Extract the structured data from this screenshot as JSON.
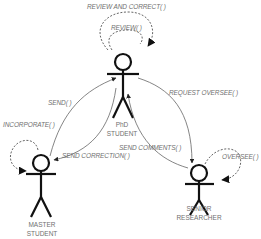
{
  "diagram": {
    "type": "actor interaction diagram",
    "actors": [
      {
        "id": "phd",
        "line1": "PhD",
        "line2": "STUDENT"
      },
      {
        "id": "master",
        "line1": "MASTER",
        "line2": "STUDENT"
      },
      {
        "id": "senior",
        "line1": "SENIOR",
        "line2": "RESEARCHER"
      }
    ],
    "messages": {
      "review_and_correct": "REVIEW AND CORRECT( )",
      "review": "REVIEW( )",
      "send": "SEND( )",
      "request_oversee": "REQUEST OVERSEE( )",
      "incorporate": "INCORPORATE( )",
      "send_comments": "SEND COMMENTS( )",
      "send_correction": "SEND CORRECTION( )",
      "oversee": "OVERSEE( )"
    },
    "edges": [
      {
        "from": "phd",
        "to": "phd",
        "label": "REVIEW AND CORRECT( )",
        "style": "dashed"
      },
      {
        "from": "phd",
        "to": "phd",
        "label": "REVIEW( )",
        "style": "dashed"
      },
      {
        "from": "master",
        "to": "phd",
        "label": "SEND( )",
        "style": "solid"
      },
      {
        "from": "phd",
        "to": "master",
        "label": "SEND CORRECTION( )",
        "style": "solid"
      },
      {
        "from": "phd",
        "to": "senior",
        "label": "REQUEST OVERSEE( )",
        "style": "solid"
      },
      {
        "from": "senior",
        "to": "phd",
        "label": "SEND COMMENTS( )",
        "style": "solid"
      },
      {
        "from": "master",
        "to": "master",
        "label": "INCORPORATE( )",
        "style": "dashed"
      },
      {
        "from": "senior",
        "to": "senior",
        "label": "OVERSEE( )",
        "style": "dashed"
      }
    ],
    "colors": {
      "stroke": "#111111",
      "line": "#666666",
      "text": "#707070"
    }
  }
}
